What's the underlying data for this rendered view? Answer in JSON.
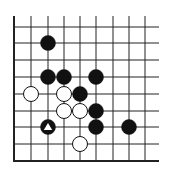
{
  "diagram": {
    "type": "go-board-fragment",
    "grid": {
      "x_lines": [
        14,
        31,
        48,
        64,
        80,
        96,
        113,
        129,
        145
      ],
      "y_lines": [
        27,
        43,
        60,
        77,
        94,
        111,
        127,
        144
      ],
      "left_edge_x": 14,
      "bottom_edge_y": 161,
      "top_y": 16,
      "right_x": 159,
      "line_color": "#222222"
    },
    "stones": [
      {
        "color": "black",
        "col": 2,
        "row": 1
      },
      {
        "color": "black",
        "col": 2,
        "row": 3
      },
      {
        "color": "black",
        "col": 3,
        "row": 3
      },
      {
        "color": "black",
        "col": 5,
        "row": 3
      },
      {
        "color": "white",
        "col": 1,
        "row": 4
      },
      {
        "color": "white",
        "col": 3,
        "row": 4
      },
      {
        "color": "black",
        "col": 4,
        "row": 4
      },
      {
        "color": "white",
        "col": 3,
        "row": 5
      },
      {
        "color": "white",
        "col": 4,
        "row": 5
      },
      {
        "color": "black",
        "col": 5,
        "row": 5
      },
      {
        "color": "black",
        "col": 2,
        "row": 6,
        "mark": "triangle"
      },
      {
        "color": "black",
        "col": 5,
        "row": 6
      },
      {
        "color": "black",
        "col": 7,
        "row": 6
      },
      {
        "color": "white",
        "col": 4,
        "row": 7
      }
    ],
    "stone_radius": 7.5
  }
}
